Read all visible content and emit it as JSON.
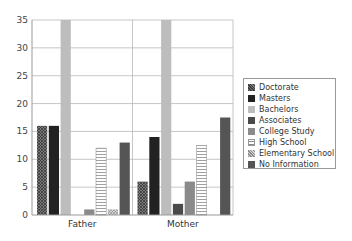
{
  "chart_data": {
    "type": "bar",
    "title": "",
    "xlabel": "",
    "ylabel": "",
    "categories": [
      "Father",
      "Mother"
    ],
    "ylim": [
      0,
      35
    ],
    "yticks": [
      0,
      5,
      10,
      15,
      20,
      25,
      30,
      35
    ],
    "grid": true,
    "legend_position": "right",
    "series": [
      {
        "name": "Doctorate",
        "values": [
          16,
          6
        ],
        "color": "#6a6a6a",
        "pattern": "crosshatch"
      },
      {
        "name": "Masters",
        "values": [
          16,
          14
        ],
        "color": "#222222",
        "pattern": "solid"
      },
      {
        "name": "Bachelors",
        "values": [
          35,
          35
        ],
        "color": "#bdbdbd",
        "pattern": "solid"
      },
      {
        "name": "Associates",
        "values": [
          0,
          2
        ],
        "color": "#4a4a4a",
        "pattern": "solid"
      },
      {
        "name": "College Study",
        "values": [
          1,
          6
        ],
        "color": "#8a8a8a",
        "pattern": "solid"
      },
      {
        "name": "High School",
        "values": [
          12,
          12.5
        ],
        "color": "#ffffff",
        "pattern": "horizontal-lines"
      },
      {
        "name": "Elementary School",
        "values": [
          1,
          0
        ],
        "color": "#b0b0b0",
        "pattern": "dots"
      },
      {
        "name": "No Information",
        "values": [
          13,
          17.5
        ],
        "color": "#555555",
        "pattern": "solid"
      }
    ]
  }
}
